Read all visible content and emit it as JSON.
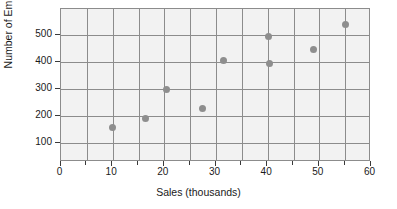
{
  "chart_data": {
    "type": "scatter",
    "title": "",
    "xlabel": "Sales (thousands)",
    "ylabel": "Number of Employees",
    "xlim": [
      0,
      60
    ],
    "ylim": [
      30,
      596
    ],
    "xticks": [
      0,
      10,
      20,
      30,
      40,
      50,
      60
    ],
    "xticklabels": [
      "0",
      "10",
      "20",
      "30",
      "40",
      "50",
      "60"
    ],
    "xminorticks": [
      5,
      15,
      25,
      35,
      45,
      55
    ],
    "yticks": [
      100,
      200,
      300,
      400,
      500
    ],
    "yticklabels": [
      "100",
      "200",
      "300",
      "400",
      "500"
    ],
    "grid": true,
    "legend": "none",
    "plot_background": "#f2f2f2",
    "grid_color": "#8c8c8c",
    "marker_color": "#8e8e8e",
    "points": [
      {
        "x": 10.0,
        "y": 157
      },
      {
        "x": 16.5,
        "y": 190
      },
      {
        "x": 20.5,
        "y": 300
      },
      {
        "x": 27.5,
        "y": 227
      },
      {
        "x": 31.5,
        "y": 407
      },
      {
        "x": 40.3,
        "y": 495
      },
      {
        "x": 40.5,
        "y": 395
      },
      {
        "x": 49.0,
        "y": 445
      },
      {
        "x": 55.2,
        "y": 537
      }
    ]
  }
}
